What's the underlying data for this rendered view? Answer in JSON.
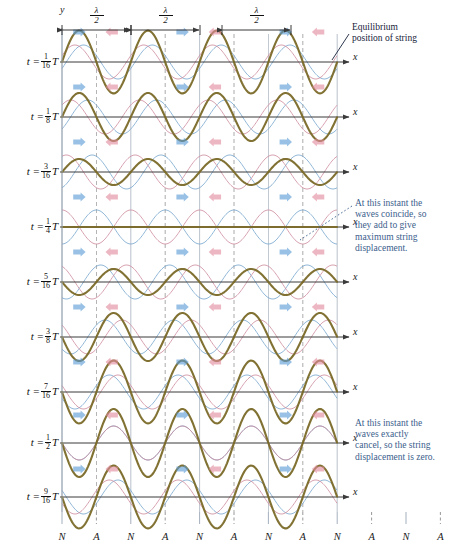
{
  "figure": {
    "title_axis_y": "y",
    "axis_x_label": "x",
    "wavelength_markers": [
      {
        "label_num": "λ",
        "label_den": "2",
        "x_start": 62,
        "x_end": 131
      },
      {
        "label_num": "λ",
        "label_den": "2",
        "x_start": 131,
        "x_end": 200
      },
      {
        "label_num": "λ",
        "label_den": "2",
        "x_start": 222,
        "x_end": 291
      }
    ],
    "annotations": [
      {
        "name": "equilibrium-note",
        "text": "Equilibrium position of string",
        "lines": [
          "Equilibrium",
          "position of string"
        ],
        "color": "#17233a",
        "x": 352,
        "y": 22,
        "leader": {
          "x1": 349,
          "y1": 34,
          "x2": 332,
          "y2": 60,
          "style": "solid"
        }
      },
      {
        "name": "coincide-note",
        "text": "At this instant the waves coincide, so they add to give maximum string displacement.",
        "lines": [
          "At this instant the",
          "waves coincide, so",
          "they add to give",
          "maximum string",
          "displacement."
        ],
        "color": "#3b5e8c",
        "x": 355,
        "y": 198,
        "leader": {
          "x1": 352,
          "y1": 206,
          "x2": 300,
          "y2": 240,
          "style": "dotted"
        }
      },
      {
        "name": "cancel-note",
        "text": "At this instant the waves exactly cancel, so the string displacement is zero.",
        "lines": [
          "At this instant the",
          "waves exactly",
          "cancel, so the string",
          "displacement is zero."
        ],
        "color": "#3b5e8c",
        "x": 355,
        "y": 418,
        "leader": null
      }
    ],
    "node_antinode_row": {
      "labels": [
        "N",
        "A",
        "N",
        "A",
        "N",
        "A",
        "N",
        "A",
        "N",
        "A",
        "N",
        "A",
        "N"
      ],
      "y_text": 540,
      "tick_top": 512,
      "tick_bottom": 524
    },
    "colors": {
      "wave_right": "#7aa8cf",
      "wave_left": "#cf8fa0",
      "resultant": "#7a6a28",
      "axis": "#3a3a3a",
      "grid_solid": "#9aa6b5",
      "grid_dashed": "#8c8c8c",
      "annotation_blue": "#3b5e8c",
      "annotation_dark": "#17233a",
      "arrow_right": "#5b9bd5",
      "arrow_left": "#e08a9c"
    },
    "geometry": {
      "plot_left": 62,
      "plot_right": 337,
      "half_wavelength_px": 34.4,
      "amplitude_px": 17,
      "row_height": 55
    },
    "rows": [
      {
        "name": "row-t-1-16",
        "t_num": "1",
        "t_den": "16",
        "baseline_y": 62,
        "phase_fraction": 0.0625,
        "arrows_y_offset": -30,
        "arrow_pairs": 3,
        "note": "waves offset, resultant moderate"
      },
      {
        "name": "row-t-1-8",
        "t_num": "1",
        "t_den": "8",
        "baseline_y": 117,
        "phase_fraction": 0.125,
        "arrows_y_offset": -30,
        "arrow_pairs": 3,
        "note": "waves approaching coincidence"
      },
      {
        "name": "row-t-3-16",
        "t_num": "3",
        "t_den": "16",
        "baseline_y": 172,
        "phase_fraction": 0.1875,
        "arrows_y_offset": -30,
        "arrow_pairs": 3,
        "note": "near coincidence"
      },
      {
        "name": "row-t-1-4",
        "t_num": "1",
        "t_den": "4",
        "baseline_y": 227,
        "phase_fraction": 0.25,
        "arrows_y_offset": -30,
        "arrow_pairs": 3,
        "note": "waves coincide, maximum displacement"
      },
      {
        "name": "row-t-5-16",
        "t_num": "5",
        "t_den": "16",
        "baseline_y": 282,
        "phase_fraction": 0.3125,
        "arrows_y_offset": -30,
        "arrow_pairs": 3,
        "note": "separating again"
      },
      {
        "name": "row-t-3-8",
        "t_num": "3",
        "t_den": "8",
        "baseline_y": 337,
        "phase_fraction": 0.375,
        "arrows_y_offset": -30,
        "arrow_pairs": 3,
        "note": "decreasing amplitude"
      },
      {
        "name": "row-t-7-16",
        "t_num": "7",
        "t_den": "16",
        "baseline_y": 392,
        "phase_fraction": 0.4375,
        "arrows_y_offset": -30,
        "arrow_pairs": 3,
        "note": "small resultant"
      },
      {
        "name": "row-t-1-2",
        "t_num": "1",
        "t_den": "2",
        "baseline_y": 443,
        "phase_fraction": 0.5,
        "arrows_y_offset": -28,
        "arrow_pairs": 3,
        "note": "waves cancel, zero displacement"
      },
      {
        "name": "row-t-9-16",
        "t_num": "9",
        "t_den": "16",
        "baseline_y": 497,
        "phase_fraction": 0.5625,
        "arrows_y_offset": -28,
        "arrow_pairs": 3,
        "note": "resultant grows inverted"
      }
    ],
    "time_prefix": "t  =",
    "time_suffix": "T"
  }
}
